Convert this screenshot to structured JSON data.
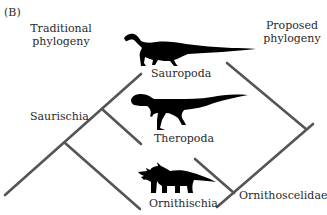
{
  "figure": {
    "panel_label": "(B)",
    "left_title_line1": "Traditional",
    "left_title_line2": "phylogeny",
    "right_title_line1": "Proposed",
    "right_title_line2": "phylogeny"
  },
  "taxa": {
    "sauropoda": "Sauropoda",
    "theropoda": "Theropoda",
    "ornithischia": "Ornithischia"
  },
  "clades": {
    "saurischia": "Saurischia",
    "ornithoscelidae": "Ornithoscelidae"
  },
  "colors": {
    "line": "#555555",
    "silhouette": "#000000",
    "text": "#2a2a2a"
  },
  "icons": {
    "sauropod": "sauropod-silhouette",
    "theropod": "theropod-silhouette",
    "ceratopsian": "ceratopsian-silhouette"
  }
}
